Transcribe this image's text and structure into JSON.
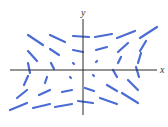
{
  "diagram": {
    "type": "slope-field",
    "width": 168,
    "height": 127,
    "colors": {
      "segment": "#4a6cd4",
      "axis": "#2b2b2b",
      "background": "#ffffff"
    },
    "segment_width": 2.2,
    "axes": {
      "x": {
        "label": "x",
        "x1": 10,
        "y1": 70,
        "x2": 157,
        "y2": 70,
        "label_x": 160,
        "label_y": 73
      },
      "y": {
        "label": "y",
        "x1": 83,
        "y1": 19,
        "x2": 83,
        "y2": 115,
        "label_x": 81,
        "label_y": 16
      }
    },
    "segments": [
      {
        "x1": 28,
        "y1": 35,
        "x2": 43,
        "y2": 45
      },
      {
        "x1": 50,
        "y1": 35,
        "x2": 65,
        "y2": 42
      },
      {
        "x1": 73,
        "y1": 36,
        "x2": 89,
        "y2": 37
      },
      {
        "x1": 95,
        "y1": 37,
        "x2": 112,
        "y2": 34
      },
      {
        "x1": 117,
        "y1": 38,
        "x2": 135,
        "y2": 31
      },
      {
        "x1": 140,
        "y1": 38,
        "x2": 157,
        "y2": 27
      },
      {
        "x1": 28,
        "y1": 51,
        "x2": 37,
        "y2": 61
      },
      {
        "x1": 50,
        "y1": 49,
        "x2": 59,
        "y2": 55
      },
      {
        "x1": 73,
        "y1": 50,
        "x2": 83,
        "y2": 52
      },
      {
        "x1": 96,
        "y1": 50,
        "x2": 107,
        "y2": 47
      },
      {
        "x1": 118,
        "y1": 52,
        "x2": 128,
        "y2": 43
      },
      {
        "x1": 140,
        "y1": 51,
        "x2": 146,
        "y2": 41
      },
      {
        "x1": 28,
        "y1": 63,
        "x2": 30,
        "y2": 73
      },
      {
        "x1": 51,
        "y1": 63,
        "x2": 54,
        "y2": 69
      },
      {
        "x1": 73,
        "y1": 63,
        "x2": 74,
        "y2": 64
      },
      {
        "x1": 96,
        "y1": 62,
        "x2": 97,
        "y2": 61
      },
      {
        "x1": 118,
        "y1": 63,
        "x2": 121,
        "y2": 57
      },
      {
        "x1": 138,
        "y1": 63,
        "x2": 141,
        "y2": 53
      },
      {
        "x1": 136,
        "y1": 67,
        "x2": 139,
        "y2": 77
      },
      {
        "x1": 113,
        "y1": 70,
        "x2": 117,
        "y2": 77
      },
      {
        "x1": 93,
        "y1": 75,
        "x2": 94,
        "y2": 76
      },
      {
        "x1": 70,
        "y1": 77,
        "x2": 71,
        "y2": 78
      },
      {
        "x1": 47,
        "y1": 77,
        "x2": 45,
        "y2": 83
      },
      {
        "x1": 28,
        "y1": 76,
        "x2": 24,
        "y2": 85
      },
      {
        "x1": 17,
        "y1": 98,
        "x2": 27,
        "y2": 90
      },
      {
        "x1": 39,
        "y1": 95,
        "x2": 50,
        "y2": 90
      },
      {
        "x1": 62,
        "y1": 92,
        "x2": 72,
        "y2": 90
      },
      {
        "x1": 85,
        "y1": 88,
        "x2": 94,
        "y2": 91
      },
      {
        "x1": 107,
        "y1": 85,
        "x2": 117,
        "y2": 91
      },
      {
        "x1": 128,
        "y1": 80,
        "x2": 138,
        "y2": 90
      },
      {
        "x1": 10,
        "y1": 110,
        "x2": 27,
        "y2": 103
      },
      {
        "x1": 33,
        "y1": 108,
        "x2": 50,
        "y2": 104
      },
      {
        "x1": 55,
        "y1": 107,
        "x2": 72,
        "y2": 104
      },
      {
        "x1": 78,
        "y1": 101,
        "x2": 93,
        "y2": 103
      },
      {
        "x1": 100,
        "y1": 98,
        "x2": 117,
        "y2": 104
      },
      {
        "x1": 122,
        "y1": 93,
        "x2": 138,
        "y2": 103
      }
    ]
  }
}
